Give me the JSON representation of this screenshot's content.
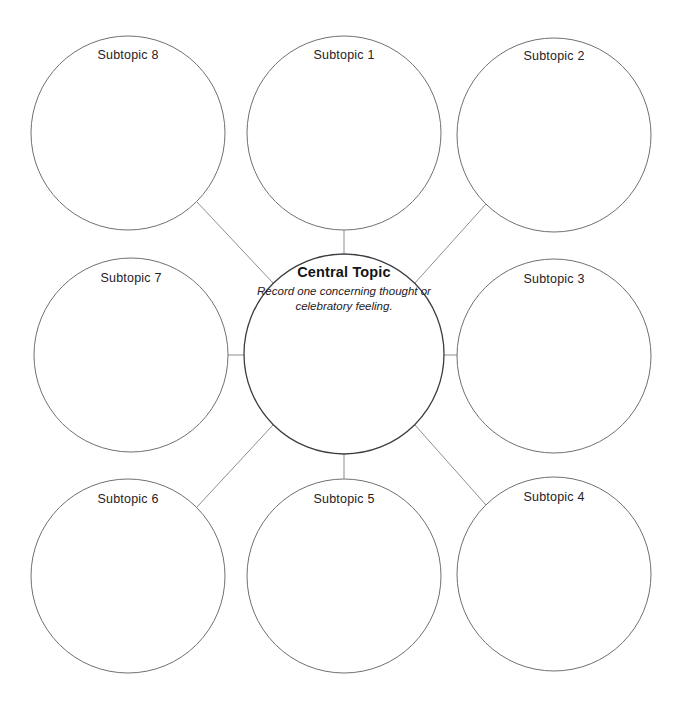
{
  "diagram": {
    "type": "bubble-map",
    "background_color": "#ffffff",
    "stroke_color": "#6e7073",
    "central_stroke_color": "#3a3d42",
    "connector_color": "#8d8f93",
    "text_color": "#1f2124",
    "central": {
      "title": "Central Topic",
      "subtitle": "Record one concerning thought or celebratory feeling.",
      "cx": 344,
      "cy": 354,
      "r": 100,
      "title_y": 264,
      "subtitle_y": 283
    },
    "subtopics": [
      {
        "label": "Subtopic 8",
        "cx": 128,
        "cy": 133,
        "r": 97,
        "label_y": 48
      },
      {
        "label": "Subtopic 1",
        "cx": 344,
        "cy": 133,
        "r": 97,
        "label_y": 48
      },
      {
        "label": "Subtopic 2",
        "cx": 554,
        "cy": 135,
        "r": 97,
        "label_y": 49
      },
      {
        "label": "Subtopic 7",
        "cx": 131,
        "cy": 355,
        "r": 97,
        "label_y": 271
      },
      {
        "label": "Subtopic 3",
        "cx": 554,
        "cy": 356,
        "r": 97,
        "label_y": 272
      },
      {
        "label": "Subtopic 6",
        "cx": 128,
        "cy": 576,
        "r": 97,
        "label_y": 492
      },
      {
        "label": "Subtopic 5",
        "cx": 344,
        "cy": 576,
        "r": 97,
        "label_y": 492
      },
      {
        "label": "Subtopic 4",
        "cx": 554,
        "cy": 574,
        "r": 97,
        "label_y": 490
      }
    ],
    "connectors": [
      {
        "name": "center-to-subtopic-1",
        "x1": 344,
        "y1": 254,
        "x2": 344,
        "y2": 230
      },
      {
        "name": "center-to-subtopic-5",
        "x1": 344,
        "y1": 454,
        "x2": 344,
        "y2": 479
      },
      {
        "name": "center-to-subtopic-7",
        "x1": 244,
        "y1": 355,
        "x2": 228,
        "y2": 355
      },
      {
        "name": "center-to-subtopic-3",
        "x1": 444,
        "y1": 355,
        "x2": 457,
        "y2": 355
      },
      {
        "name": "center-to-subtopic-8",
        "x1": 273,
        "y1": 283,
        "x2": 197,
        "y2": 202
      },
      {
        "name": "center-to-subtopic-2",
        "x1": 415,
        "y1": 283,
        "x2": 486,
        "y2": 204
      },
      {
        "name": "center-to-subtopic-6",
        "x1": 273,
        "y1": 425,
        "x2": 197,
        "y2": 507
      },
      {
        "name": "center-to-subtopic-4",
        "x1": 415,
        "y1": 425,
        "x2": 486,
        "y2": 505
      }
    ]
  }
}
